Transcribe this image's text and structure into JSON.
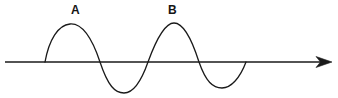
{
  "figure": {
    "type": "wave-diagram",
    "background_color": "#ffffff",
    "stroke_color": "#1a1a1a",
    "labels": [
      {
        "id": "A",
        "text": "A",
        "refers_to": "first crest",
        "x": 71,
        "y": 4
      },
      {
        "id": "B",
        "text": "B",
        "refers_to": "second crest",
        "x": 168,
        "y": 4
      }
    ],
    "axis": {
      "name": "horizontal-axis",
      "orientation": "horizontal",
      "y": 62,
      "x_start": 5,
      "x_end": 332,
      "arrowhead": "right",
      "stroke_width": 1.4
    },
    "wave": {
      "name": "sine-wave-curve",
      "start_x": 45,
      "end_x": 246,
      "baseline_y": 62,
      "cycles": 2,
      "stroke_width": 1.3,
      "fill": "none",
      "crests": [
        {
          "label": "A",
          "peak_x": 76,
          "peak_y": 24,
          "amplitude_px": 38
        },
        {
          "label": "B",
          "peak_x": 173,
          "peak_y": 23,
          "amplitude_px": 39
        }
      ],
      "troughs": [
        {
          "label": "",
          "bottom_x": 124,
          "bottom_y": 93,
          "amplitude_px": 31
        },
        {
          "label": "",
          "bottom_x": 222,
          "bottom_y": 88,
          "amplitude_px": 26
        }
      ],
      "zero_crossings": [
        45,
        100,
        148,
        199,
        246
      ],
      "path": "M45,62 C49,40 58,25 70,24 C82,23 92,38 100,62 C108,86 115,93 124,93 C133,93 141,82 148,62 C156,40 165,23 174,23 C183,23 192,40 199,62 C206,82 213,88 222,88 C231,88 240,78 246,62"
    }
  },
  "chart_data": {
    "type": "line",
    "title": "",
    "xlabel": "",
    "ylabel": "",
    "grid": false,
    "legend": null,
    "xlim": [
      0,
      338
    ],
    "ylim": [
      98,
      0
    ],
    "annotations": [
      {
        "text": "A",
        "x": 76,
        "y": 10
      },
      {
        "text": "B",
        "x": 173,
        "y": 10
      }
    ],
    "series": [
      {
        "name": "axis",
        "x": [
          5,
          332
        ],
        "values": [
          62,
          62
        ]
      },
      {
        "name": "wave",
        "x": [
          45,
          76,
          100,
          124,
          148,
          173,
          199,
          222,
          246
        ],
        "values": [
          62,
          24,
          62,
          93,
          62,
          23,
          62,
          88,
          62
        ]
      }
    ]
  }
}
